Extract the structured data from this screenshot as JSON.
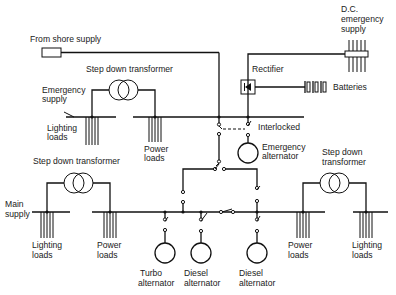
{
  "diagram": {
    "type": "ship electrical distribution schematic",
    "labels": {
      "shore_supply": "From shore supply",
      "dc_emergency_1": "D.C.",
      "dc_emergency_2": "emergency",
      "dc_emergency_3": "supply",
      "rectifier": "Rectifier",
      "batteries": "Batteries",
      "top_transformer": "Step down transformer",
      "emergency_supply_1": "Emergency",
      "emergency_supply_2": "supply",
      "top_lighting_1": "Lighting",
      "top_lighting_2": "loads",
      "top_power_1": "Power",
      "top_power_2": "loads",
      "interlocked": "Interlocked",
      "emergency_alt_1": "Emergency",
      "emergency_alt_2": "alternator",
      "left_transformer": "Step down transformer",
      "right_transformer_1": "Step down",
      "right_transformer_2": "transformer",
      "main_supply_1": "Main",
      "main_supply_2": "supply",
      "left_lighting_1": "Lighting",
      "left_lighting_2": "loads",
      "left_power_1": "Power",
      "left_power_2": "loads",
      "right_power_1": "Power",
      "right_power_2": "loads",
      "right_lighting_1": "Lighting",
      "right_lighting_2": "loads",
      "turbo_alt_1": "Turbo",
      "turbo_alt_2": "alternator",
      "diesel_alt1_1": "Diesel",
      "diesel_alt1_2": "alternator",
      "diesel_alt2_1": "Diesel",
      "diesel_alt2_2": "alternator"
    }
  }
}
